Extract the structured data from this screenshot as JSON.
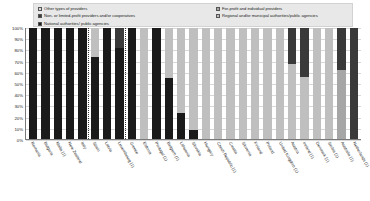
{
  "legend": {
    "left_items": [
      {
        "label": "Other types of providers",
        "color": "#d9d9d9"
      },
      {
        "label": "Non- or limited-profit providers and/or cooperatives",
        "color": "#3a3a3a"
      },
      {
        "label": "National authorities/ public agencies",
        "color": "#1a1a1a"
      }
    ],
    "right_items": [
      {
        "label": "For-profit and individual providers",
        "color": "#a6a6a6"
      },
      {
        "label": "Regional and/or municipal authorities/public agencies",
        "color": "#bfbfbf"
      }
    ]
  },
  "y_axis": {
    "ticks": [
      "100%",
      "90%",
      "80%",
      "70%",
      "60%",
      "50%",
      "40%",
      "30%",
      "20%",
      "10%",
      "0%"
    ]
  },
  "chart_data": {
    "type": "bar",
    "title": "",
    "xlabel": "",
    "ylabel": "",
    "ylim": [
      0,
      100
    ],
    "stacked": true,
    "normalized_percent": true,
    "grid": true,
    "legend_position": "top",
    "categories": [
      "Romania",
      "Bulgaria",
      "Malta (1)",
      "New Zealand",
      "Italy",
      "Spain",
      "Latvia",
      "Luxembourg (1)",
      "Greece",
      "Estonia",
      "Portugal (1)",
      "Belgium (1)",
      "Lithuania",
      "Slovakia",
      "Hungary",
      "Czech Republic (1)",
      "Croatia",
      "Slovenia",
      "Finland",
      "Poland",
      "United Kingdom (1)",
      "Austria",
      "Ireland (1)",
      "Denmark (1)",
      "Serbia (1)",
      "Australia (1)",
      "Netherlands (1)"
    ],
    "series": [
      {
        "name": "National authorities/ public agencies",
        "color": "#1a1a1a",
        "values": [
          100,
          100,
          100,
          100,
          100,
          74,
          100,
          82,
          100,
          0,
          100,
          55,
          23,
          8,
          0,
          0,
          0,
          0,
          0,
          0,
          0,
          0,
          0,
          0,
          0,
          0,
          0
        ]
      },
      {
        "name": "Regional and/or municipal authorities/public agencies",
        "color": "#bfbfbf",
        "values": [
          0,
          0,
          0,
          0,
          0,
          26,
          0,
          0,
          0,
          100,
          0,
          45,
          77,
          92,
          100,
          100,
          100,
          100,
          100,
          100,
          100,
          68,
          56,
          100,
          100,
          0,
          0
        ]
      },
      {
        "name": "For-profit and individual providers",
        "color": "#a6a6a6",
        "values": [
          0,
          0,
          0,
          0,
          0,
          0,
          0,
          0,
          0,
          0,
          0,
          0,
          0,
          0,
          0,
          0,
          0,
          0,
          0,
          0,
          0,
          0,
          0,
          0,
          0,
          62,
          0
        ]
      },
      {
        "name": "Non- or limited-profit providers and/or cooperatives",
        "color": "#3a3a3a",
        "values": [
          0,
          0,
          0,
          0,
          0,
          0,
          0,
          18,
          0,
          0,
          0,
          0,
          0,
          0,
          0,
          0,
          0,
          0,
          0,
          0,
          0,
          32,
          44,
          0,
          0,
          38,
          100
        ]
      },
      {
        "name": "Other types of providers",
        "color": "#d9d9d9",
        "values": [
          0,
          0,
          0,
          0,
          0,
          0,
          0,
          0,
          0,
          0,
          0,
          0,
          0,
          0,
          0,
          0,
          0,
          0,
          0,
          0,
          0,
          0,
          0,
          0,
          0,
          0,
          0
        ]
      }
    ],
    "separators_after_category_index": [
      4,
      7
    ]
  }
}
